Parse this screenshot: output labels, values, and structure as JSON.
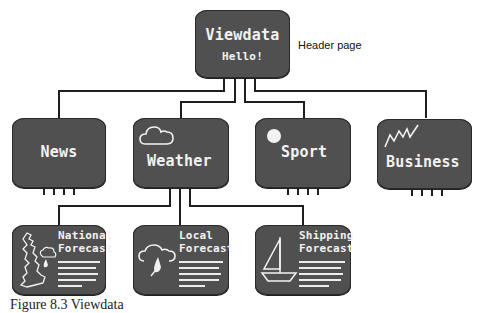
{
  "diagram": {
    "title": "Viewdata",
    "header_page": {
      "title": "Viewdata",
      "subtitle": "Hello!",
      "annotation": "Header page"
    },
    "categories": [
      {
        "label": "News",
        "icon": "none"
      },
      {
        "label": "Weather",
        "icon": "cloud-icon"
      },
      {
        "label": "Sport",
        "icon": "ball-icon"
      },
      {
        "label": "Business",
        "icon": "zigzag-graph-icon"
      }
    ],
    "weather_subpages": [
      {
        "line1": "National",
        "line2": "Forecast",
        "icon": "uk-map-icon"
      },
      {
        "line1": "Local",
        "line2": "Forecast",
        "icon": "rain-cloud-icon"
      },
      {
        "line1": "Shipping",
        "line2": "Forecast",
        "icon": "sailboat-icon"
      }
    ],
    "edges": [
      [
        "Viewdata",
        "News"
      ],
      [
        "Viewdata",
        "Weather"
      ],
      [
        "Viewdata",
        "Sport"
      ],
      [
        "Viewdata",
        "Business"
      ],
      [
        "Weather",
        "National Forecast"
      ],
      [
        "Weather",
        "Local Forecast"
      ],
      [
        "Weather",
        "Shipping Forecast"
      ]
    ],
    "colors": {
      "screen": "#505050",
      "wire": "#1e1e1e",
      "text": "#f2f2f2",
      "background": "#ffffff"
    }
  },
  "caption": "Figure 8.3 Viewdata"
}
